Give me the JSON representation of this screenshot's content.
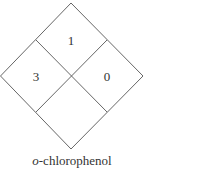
{
  "diagram": {
    "type": "NFPA 704 hazard diamond",
    "line_color": "#555555",
    "quadrants": {
      "top": "1",
      "left": "3",
      "right": "0",
      "bottom": ""
    },
    "caption": {
      "prefix": "o",
      "suffix": "-chlorophenol"
    }
  }
}
